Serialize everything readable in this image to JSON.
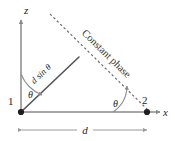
{
  "figure": {
    "background_color": "#ffffff",
    "axes": {
      "vertical_label": "z",
      "horizontal_label": "x"
    },
    "nodes": [
      {
        "id": "node-1",
        "label": "1",
        "role": "left-element"
      },
      {
        "id": "node-2",
        "label": "2",
        "role": "right-element"
      }
    ],
    "angles": [
      {
        "id": "angle-origin",
        "label": "θ",
        "location": "between z-axis and path-difference line"
      },
      {
        "id": "angle-node2",
        "label": "θ",
        "location": "between x-axis and constant-phase line"
      }
    ],
    "segments": [
      {
        "id": "path-difference",
        "label": "d sin θ",
        "style": "solid"
      },
      {
        "id": "constant-phase",
        "label": "Constant phase",
        "style": "dashed"
      },
      {
        "id": "spacing",
        "label": "d",
        "style": "dimension"
      }
    ],
    "colors": {
      "solid_line": "#555555",
      "axis_line": "#8a8a8a",
      "dashed_line": "#6e6e6e",
      "dimension_line": "#9a9a9a",
      "node_fill": "#1f1f1f",
      "text": "#262626"
    }
  }
}
